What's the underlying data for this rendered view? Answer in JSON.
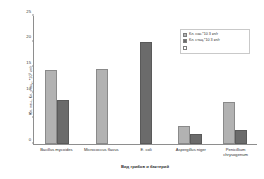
{
  "chart_data": {
    "type": "bar",
    "title": "",
    "xlabel": "Вид грибов и бактерий",
    "ylabel": "Кл. нач., Кл. стац., *10³ кл/г",
    "categories": [
      "Bacillus mycoides",
      "Micrococcus flavus",
      "E. coli",
      "Aspergillus niger",
      "Penicillium chrysogenum"
    ],
    "series": [
      {
        "name": "Кл. нач.*10 3 кл/г",
        "values": [
          14.5,
          14.7,
          0,
          3.5,
          8.3
        ],
        "color": "#b2b2b2"
      },
      {
        "name": "Кл. стац.*10 3 кл/г",
        "values": [
          8.5,
          0,
          20.0,
          2.0,
          2.8
        ],
        "color": "#6b6b6b"
      }
    ],
    "ylim": [
      0,
      25
    ],
    "yticks": [
      0,
      5,
      10,
      15,
      20,
      25
    ],
    "ytick_labels": [
      "0",
      "5",
      "10",
      "15",
      "20",
      "25"
    ],
    "grid": false,
    "legend_position": "upper-right"
  },
  "legend": {
    "entries": [
      {
        "label": "Кл. нач.*10 3 кл/г",
        "swatch": "s0"
      },
      {
        "label": "Кл. стац.*10 3 кл/г",
        "swatch": "s1"
      },
      {
        "label": "",
        "swatch": "s2"
      }
    ]
  }
}
